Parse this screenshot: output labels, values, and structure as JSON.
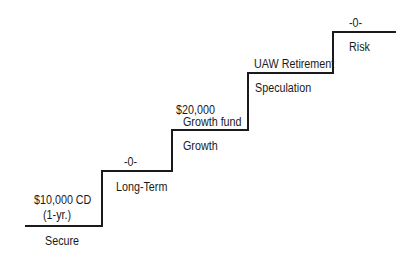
{
  "diagram": {
    "type": "staircase",
    "line_color": "#1a1a1a",
    "steps": [
      {
        "level": "Secure",
        "holding_line1": "$10,000 CD",
        "holding_line2": "(1-yr.)"
      },
      {
        "level": "Long-Term",
        "holding_line1": "-0-"
      },
      {
        "level": "Growth",
        "holding_line1": "$20,000",
        "holding_line2": "Growth fund"
      },
      {
        "level": "Speculation",
        "holding_line1": "UAW Retirement"
      },
      {
        "level": "Risk",
        "holding_line1": "-0-"
      }
    ]
  }
}
